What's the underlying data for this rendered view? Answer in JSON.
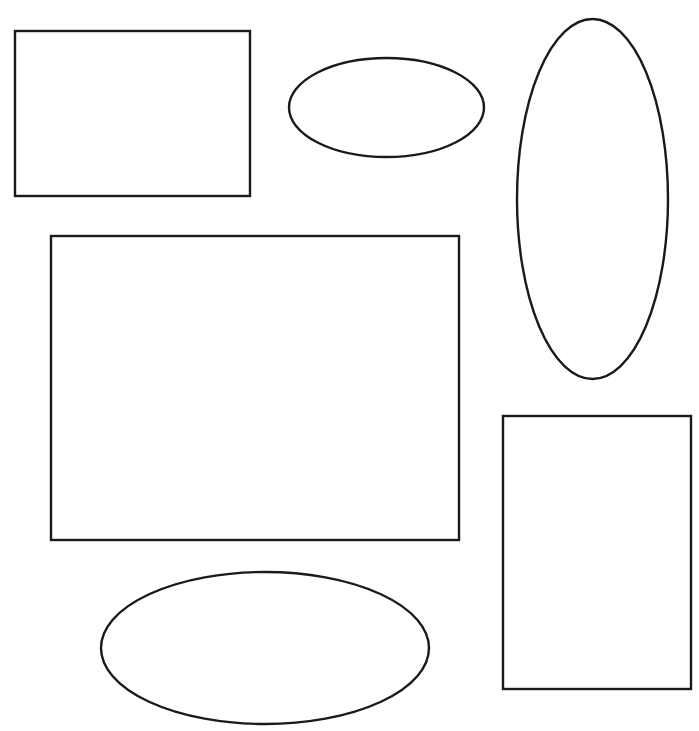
{
  "canvas": {
    "width": 699,
    "height": 731,
    "background_color": "#ffffff",
    "title": "Shapes Canvas",
    "description": "Plain white drawing canvas containing six black outlined geometric shapes: three rectangles and three ellipses, all unfilled.",
    "shape_count": "6",
    "rectangle_count": "3",
    "ellipse_count": "3"
  },
  "style": {
    "stroke_color": "#1a1a1a",
    "fill_color": "#ffffff",
    "stroke_width": "2.4"
  },
  "shapes": [
    {
      "id": "rect-top-left",
      "label": "Rectangle top-left",
      "type": "rectangle",
      "x": 15,
      "y": 31,
      "width": 235,
      "height": 165,
      "center_x": 132.5,
      "center_y": 113.5
    },
    {
      "id": "ellipse-top-middle",
      "label": "Ellipse top-middle",
      "type": "ellipse",
      "x": 289,
      "y": 58,
      "width": 195,
      "height": 99,
      "center_x": 386.5,
      "center_y": 107.5,
      "radius_x": 97.5,
      "radius_y": 49.5
    },
    {
      "id": "ellipse-right-tall",
      "label": "Ellipse right tall",
      "type": "ellipse",
      "x": 517,
      "y": 19,
      "width": 151,
      "height": 360,
      "center_x": 592.5,
      "center_y": 199,
      "radius_x": 75.5,
      "radius_y": 180
    },
    {
      "id": "rect-center-large",
      "label": "Rectangle center large",
      "type": "rectangle",
      "x": 51,
      "y": 236,
      "width": 408,
      "height": 304,
      "center_x": 255,
      "center_y": 388
    },
    {
      "id": "rect-bottom-right",
      "label": "Rectangle bottom-right",
      "type": "rectangle",
      "x": 503,
      "y": 416,
      "width": 188,
      "height": 273,
      "center_x": 597,
      "center_y": 552.5
    },
    {
      "id": "ellipse-bottom",
      "label": "Ellipse bottom",
      "type": "ellipse",
      "x": 101,
      "y": 572,
      "width": 328,
      "height": 152,
      "center_x": 265,
      "center_y": 648,
      "radius_x": 164,
      "radius_y": 76
    }
  ]
}
